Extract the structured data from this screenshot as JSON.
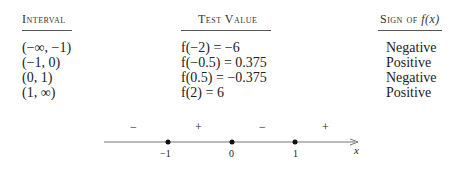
{
  "headers": {
    "interval": "Interval",
    "test_value": "Test Value",
    "sign_prefix": "Sign of ",
    "sign_fx": "f(x)"
  },
  "rows": [
    {
      "interval": "(−∞, −1)",
      "test_value": "f(−2) = −6",
      "sign": "Negative"
    },
    {
      "interval": "(−1, 0)",
      "test_value": "f(−0.5) = 0.375",
      "sign": "Positive"
    },
    {
      "interval": "(0, 1)",
      "test_value": "f(0.5) = −0.375",
      "sign": "Negative"
    },
    {
      "interval": "(1, ∞)",
      "test_value": "f(2) = 6",
      "sign": "Positive"
    }
  ],
  "number_line": {
    "signs": [
      "−",
      "+",
      "−",
      "+"
    ],
    "ticks": [
      "−1",
      "0",
      "1"
    ],
    "axis_label": "x"
  }
}
